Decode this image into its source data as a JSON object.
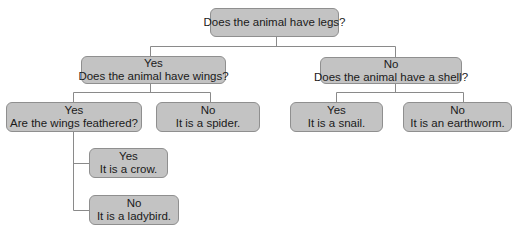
{
  "diagram": {
    "type": "decision-tree",
    "nodes": {
      "root": {
        "line1": "Does the animal have legs?"
      },
      "legs_yes": {
        "line0": "Yes",
        "line1": "Does the animal have wings?"
      },
      "legs_no": {
        "line0": "No",
        "line1": "Does the animal have a shell?"
      },
      "wings_yes": {
        "line0": "Yes",
        "line1": "Are the wings feathered?"
      },
      "wings_no": {
        "line0": "No",
        "line1": "It is a spider."
      },
      "shell_yes": {
        "line0": "Yes",
        "line1": "It is a snail."
      },
      "shell_no": {
        "line0": "No",
        "line1": "It is an earthworm."
      },
      "feathered_yes": {
        "line0": "Yes",
        "line1": "It is a crow."
      },
      "feathered_no": {
        "line0": "No",
        "line1": "It is a ladybird."
      }
    },
    "edges": [
      [
        "root",
        "legs_yes"
      ],
      [
        "root",
        "legs_no"
      ],
      [
        "legs_yes",
        "wings_yes"
      ],
      [
        "legs_yes",
        "wings_no"
      ],
      [
        "legs_no",
        "shell_yes"
      ],
      [
        "legs_no",
        "shell_no"
      ],
      [
        "wings_yes",
        "feathered_yes"
      ],
      [
        "wings_yes",
        "feathered_no"
      ]
    ]
  },
  "colors": {
    "node_fill": "#c3c3c3",
    "node_border": "#8f8f8f",
    "line": "#8a8a8a",
    "text": "#1a1a1a"
  }
}
